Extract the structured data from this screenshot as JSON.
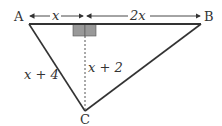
{
  "diagram": {
    "vertices": {
      "A": "A",
      "B": "B",
      "C": "C"
    },
    "labels": {
      "segment_left": "x",
      "segment_right": "2x",
      "side_ac": "x + 4",
      "altitude": "x + 2"
    },
    "colors": {
      "stroke": "#333333",
      "shade": "#999999",
      "background": "#ffffff"
    }
  }
}
